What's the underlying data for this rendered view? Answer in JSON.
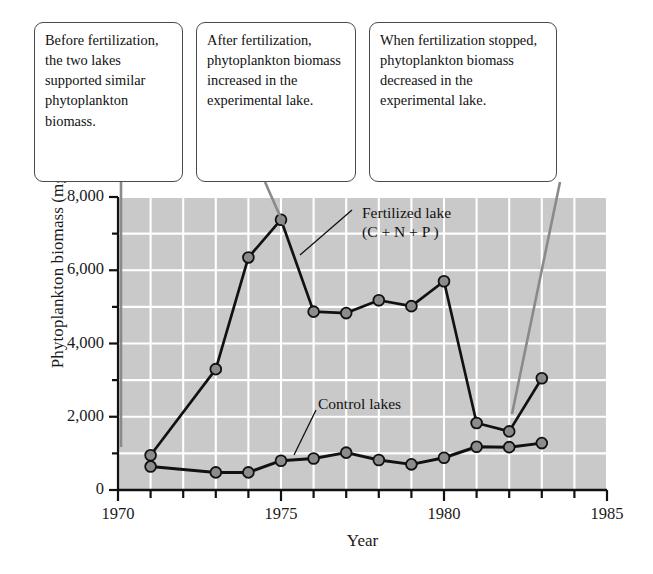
{
  "figure": {
    "callouts": [
      {
        "id": "callout-1",
        "text": "Before fertilization, the two lakes supported similar phytoplankton biomass."
      },
      {
        "id": "callout-2",
        "text": "After fertilization, phytoplankton biomass increased in the experimental lake."
      },
      {
        "id": "callout-3",
        "text": "When fertilization stopped, phytoplankton biomass decreased in the experimental lake."
      }
    ],
    "series_notes": {
      "fertilized_line1": "Fertilized lake",
      "fertilized_line2": "(C + N + P )",
      "control": "Control lakes"
    },
    "colors": {
      "plot_background": "#c9c9c9",
      "gridline": "#ffffff",
      "marker_fill": "#8c8c8c",
      "line": "#111111",
      "axis": "#111111",
      "callout_border": "#4a4a4a",
      "leader_line": "#8a8a8a"
    }
  },
  "chart_data": {
    "type": "line",
    "title": "",
    "xlabel": "Year",
    "ylabel": "Phytoplankton biomass (mg/m3)",
    "ylabel_unit_base": "Phytoplankton biomass (mg/m",
    "ylabel_unit_exp": "3",
    "ylabel_unit_tail": ")",
    "xlim": [
      1970,
      1985
    ],
    "ylim": [
      0,
      8000
    ],
    "xticks": [
      1970,
      1971,
      1972,
      1973,
      1974,
      1975,
      1976,
      1977,
      1978,
      1979,
      1980,
      1981,
      1982,
      1983,
      1984,
      1985
    ],
    "xtick_labels": [
      "1970",
      "1975",
      "1980",
      "1985"
    ],
    "xtick_label_values": [
      1970,
      1975,
      1980,
      1985
    ],
    "yticks": [
      0,
      1000,
      2000,
      3000,
      4000,
      5000,
      6000,
      7000,
      8000
    ],
    "ytick_labels": [
      "0",
      "2,000",
      "4,000",
      "6,000",
      "8,000"
    ],
    "ytick_label_values": [
      0,
      2000,
      4000,
      6000,
      8000
    ],
    "grid": true,
    "legend": "inline-annotations",
    "series": [
      {
        "name": "Fertilized lake (C + N + P )",
        "x": [
          1971,
          1973,
          1974,
          1975,
          1976,
          1977,
          1978,
          1979,
          1980,
          1981,
          1982,
          1983
        ],
        "values": [
          950,
          3300,
          6350,
          7380,
          4870,
          4830,
          5180,
          5020,
          5700,
          1830,
          1600,
          3050
        ]
      },
      {
        "name": "Control lakes",
        "x": [
          1971,
          1973,
          1974,
          1975,
          1976,
          1977,
          1978,
          1979,
          1980,
          1981,
          1982,
          1983
        ],
        "values": [
          640,
          480,
          480,
          800,
          860,
          1020,
          820,
          700,
          880,
          1180,
          1170,
          1280
        ]
      }
    ]
  }
}
